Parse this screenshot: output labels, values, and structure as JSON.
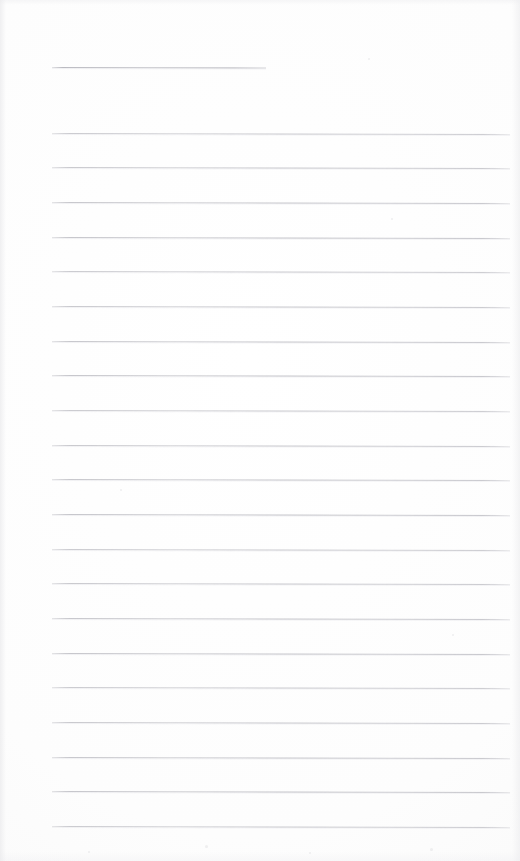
{
  "document": {
    "kind": "scanned-lined-notepaper",
    "title": "Blank ruled page",
    "page_width": 520,
    "page_height": 861,
    "background_color": "#fdfdfd",
    "rule_color": "#c0c0c6",
    "content_text": "",
    "note": "No handwriting or printed text present on the page"
  },
  "ruling": {
    "left_margin": 52,
    "right_edge": 510,
    "line_spacing": 34.65,
    "line_thickness": 1,
    "skew_degrees": 0.12,
    "header_rule": {
      "label": "header-rule",
      "y": 67,
      "x_start": 52,
      "x_end": 266,
      "width": 214
    },
    "body_rule_count": 21,
    "body_rules": [
      {
        "y": 133,
        "x_start": 52,
        "x_end": 510
      },
      {
        "y": 167,
        "x_start": 52,
        "x_end": 510
      },
      {
        "y": 202,
        "x_start": 52,
        "x_end": 510
      },
      {
        "y": 237,
        "x_start": 52,
        "x_end": 510
      },
      {
        "y": 271,
        "x_start": 52,
        "x_end": 510
      },
      {
        "y": 306,
        "x_start": 52,
        "x_end": 510
      },
      {
        "y": 341,
        "x_start": 52,
        "x_end": 510
      },
      {
        "y": 375,
        "x_start": 52,
        "x_end": 510
      },
      {
        "y": 410,
        "x_start": 52,
        "x_end": 510
      },
      {
        "y": 445,
        "x_start": 52,
        "x_end": 510
      },
      {
        "y": 479,
        "x_start": 52,
        "x_end": 510
      },
      {
        "y": 514,
        "x_start": 52,
        "x_end": 510
      },
      {
        "y": 549,
        "x_start": 52,
        "x_end": 510
      },
      {
        "y": 583,
        "x_start": 52,
        "x_end": 510
      },
      {
        "y": 618,
        "x_start": 52,
        "x_end": 510
      },
      {
        "y": 653,
        "x_start": 52,
        "x_end": 510
      },
      {
        "y": 687,
        "x_start": 52,
        "x_end": 510
      },
      {
        "y": 722,
        "x_start": 52,
        "x_end": 510
      },
      {
        "y": 757,
        "x_start": 52,
        "x_end": 510
      },
      {
        "y": 791,
        "x_start": 52,
        "x_end": 510
      },
      {
        "y": 826,
        "x_start": 52,
        "x_end": 510
      }
    ]
  },
  "specks": [
    {
      "x": 368,
      "y": 58,
      "d": 2
    },
    {
      "x": 391,
      "y": 218,
      "d": 2
    },
    {
      "x": 120,
      "y": 489,
      "d": 2
    },
    {
      "x": 452,
      "y": 634,
      "d": 2
    },
    {
      "x": 205,
      "y": 845,
      "d": 3
    },
    {
      "x": 309,
      "y": 852,
      "d": 2
    },
    {
      "x": 88,
      "y": 851,
      "d": 2
    },
    {
      "x": 430,
      "y": 848,
      "d": 3
    }
  ]
}
